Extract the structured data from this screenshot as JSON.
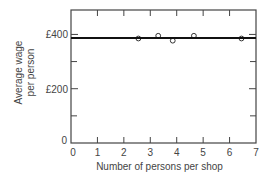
{
  "chart_data": {
    "type": "scatter",
    "title": "",
    "xlabel": "Number of persons per shop",
    "ylabel": "Average wage per person",
    "ylabel_lines": [
      "Average wage",
      "per person"
    ],
    "xlim": [
      0,
      7
    ],
    "ylim": [
      0,
      490
    ],
    "x_ticks": [
      0,
      1,
      2,
      3,
      4,
      5,
      6,
      7
    ],
    "x_tick_labels": [
      "0",
      "1",
      "2",
      "3",
      "4",
      "5",
      "6",
      "7"
    ],
    "y_ticks": [
      0,
      200,
      400
    ],
    "y_tick_labels": [
      "0",
      "£200",
      "£400"
    ],
    "y_minor_ticks": [
      100,
      300
    ],
    "grid": false,
    "series": [
      {
        "name": "observations",
        "marker": "open-circle",
        "x": [
          2.55,
          3.3,
          3.85,
          4.65,
          6.45
        ],
        "y": [
          385,
          395,
          377,
          395,
          385
        ]
      },
      {
        "name": "fitted line",
        "type": "line",
        "x": [
          0,
          7
        ],
        "y": [
          387,
          387
        ]
      }
    ]
  },
  "colors": {
    "axis": "#444444",
    "line": "#111111",
    "marker": "#333333"
  }
}
